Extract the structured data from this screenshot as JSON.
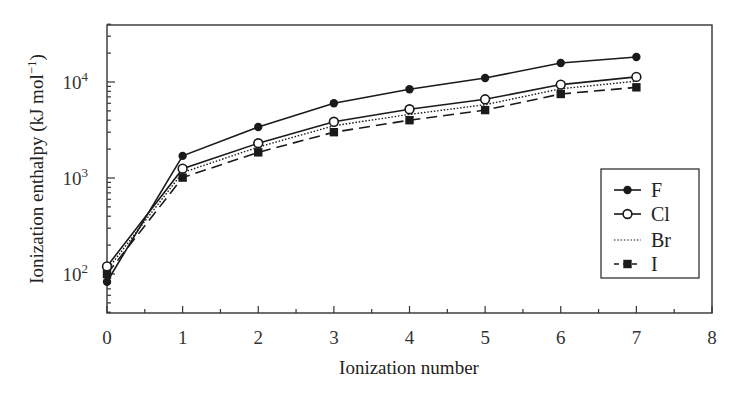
{
  "chart_data": {
    "type": "line",
    "title": "",
    "xlabel": "Ionization number",
    "ylabel": "Ionization enthalpy (kJ mol",
    "ylabel_superscript": "−1",
    "ylabel_close": ")",
    "xlim": [
      0,
      8
    ],
    "ylim": [
      35,
      40000
    ],
    "yscale": "log",
    "x_ticks": [
      0,
      1,
      2,
      3,
      4,
      5,
      6,
      7,
      8
    ],
    "x_tick_labels": [
      "0",
      "1",
      "2",
      "3",
      "4",
      "5",
      "6",
      "7",
      "8"
    ],
    "y_ticks": [
      100,
      1000,
      10000
    ],
    "y_tick_labels": [
      {
        "base": "10",
        "exp": "2"
      },
      {
        "base": "10",
        "exp": "3"
      },
      {
        "base": "10",
        "exp": "4"
      }
    ],
    "grid": false,
    "legend_position": "right-middle",
    "x": [
      0,
      1,
      2,
      3,
      4,
      5,
      6,
      7
    ],
    "series": [
      {
        "name": "F",
        "marker": "filled-circle",
        "line": "solid",
        "values": [
          83,
          1700,
          3400,
          6000,
          8400,
          11000,
          15800,
          18200
        ]
      },
      {
        "name": "Cl",
        "marker": "open-circle",
        "line": "solid",
        "values": [
          120,
          1250,
          2300,
          3850,
          5200,
          6600,
          9400,
          11300
        ]
      },
      {
        "name": "Br",
        "marker": "none",
        "line": "dotted",
        "values": [
          110,
          1140,
          2100,
          3500,
          4600,
          5800,
          8500,
          10200
        ]
      },
      {
        "name": "I",
        "marker": "filled-square",
        "line": "dashed",
        "values": [
          100,
          1010,
          1850,
          3000,
          4000,
          5100,
          7500,
          8800
        ]
      }
    ]
  },
  "colors": {
    "line": "#1a1a1a",
    "axis": "#333333",
    "background": "#ffffff"
  }
}
